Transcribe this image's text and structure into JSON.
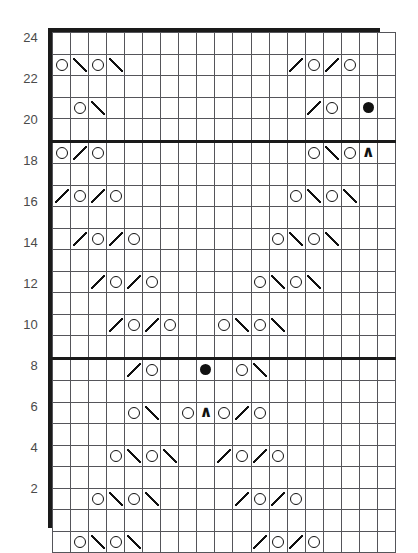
{
  "chart_data": {
    "type": "table",
    "rows": 24,
    "columns": 19,
    "row_numbers_right": [
      23,
      21,
      19,
      17,
      15,
      13,
      11,
      9,
      7,
      5,
      3,
      1
    ],
    "row_numbers_left": [
      24,
      22,
      20,
      18,
      16,
      14,
      12,
      10,
      8,
      6,
      4,
      2
    ],
    "repeat_divider_after_column": 7,
    "section_dividers_after_rows": [
      10,
      20
    ],
    "legend": {
      "O": "yarn-over",
      "/": "k2tog-right-slant-decrease",
      "\\": "ssk-left-slant-decrease",
      "dot": "purl-or-bobble",
      "^": "central-double-decrease"
    },
    "grid": [
      {
        "row": 24,
        "cells": [
          "",
          "",
          "",
          "",
          "",
          "",
          "",
          "",
          "",
          "",
          "",
          "",
          "",
          "",
          "",
          "",
          "",
          "",
          ""
        ]
      },
      {
        "row": 23,
        "cells": [
          "O",
          "/",
          "O",
          "/",
          "",
          "",
          "",
          "",
          "",
          "",
          "",
          "",
          "",
          "\\",
          "O",
          "\\",
          "O",
          "",
          ""
        ]
      },
      {
        "row": 22,
        "cells": [
          "",
          "",
          "",
          "",
          "",
          "",
          "",
          "",
          "",
          "",
          "",
          "",
          "",
          "",
          "",
          "",
          "",
          "",
          ""
        ]
      },
      {
        "row": 21,
        "cells": [
          "",
          "O",
          "/",
          "",
          "",
          "",
          "",
          "",
          "",
          "",
          "",
          "",
          "",
          "",
          "\\",
          "O",
          "",
          "dot",
          ""
        ]
      },
      {
        "row": 20,
        "cells": [
          "",
          "",
          "",
          "",
          "",
          "",
          "",
          "",
          "",
          "",
          "",
          "",
          "",
          "",
          "",
          "",
          "",
          "",
          ""
        ]
      },
      {
        "row": 19,
        "cells": [
          "O",
          "\\",
          "O",
          "",
          "",
          "",
          "",
          "",
          "",
          "",
          "",
          "",
          "",
          "",
          "O",
          "/",
          "O",
          "^",
          ""
        ]
      },
      {
        "row": 18,
        "cells": [
          "",
          "",
          "",
          "",
          "",
          "",
          "",
          "",
          "",
          "",
          "",
          "",
          "",
          "",
          "",
          "",
          "",
          "",
          ""
        ]
      },
      {
        "row": 17,
        "cells": [
          "\\",
          "O",
          "\\",
          "O",
          "",
          "",
          "",
          "",
          "",
          "",
          "",
          "",
          "",
          "O",
          "/",
          "O",
          "/",
          "",
          ""
        ]
      },
      {
        "row": 16,
        "cells": [
          "",
          "",
          "",
          "",
          "",
          "",
          "",
          "",
          "",
          "",
          "",
          "",
          "",
          "",
          "",
          "",
          "",
          "",
          ""
        ]
      },
      {
        "row": 15,
        "cells": [
          "",
          "\\",
          "O",
          "\\",
          "O",
          "",
          "",
          "",
          "",
          "",
          "",
          "",
          "O",
          "/",
          "O",
          "/",
          "",
          "",
          ""
        ]
      },
      {
        "row": 14,
        "cells": [
          "",
          "",
          "",
          "",
          "",
          "",
          "",
          "",
          "",
          "",
          "",
          "",
          "",
          "",
          "",
          "",
          "",
          "",
          ""
        ]
      },
      {
        "row": 13,
        "cells": [
          "",
          "",
          "\\",
          "O",
          "\\",
          "O",
          "",
          "",
          "",
          "",
          "",
          "O",
          "/",
          "O",
          "/",
          "",
          "",
          "",
          ""
        ]
      },
      {
        "row": 12,
        "cells": [
          "",
          "",
          "",
          "",
          "",
          "",
          "",
          "",
          "",
          "",
          "",
          "",
          "",
          "",
          "",
          "",
          "",
          "",
          ""
        ]
      },
      {
        "row": 11,
        "cells": [
          "",
          "",
          "",
          "\\",
          "O",
          "\\",
          "O",
          "",
          "",
          "O",
          "/",
          "O",
          "/",
          "",
          "",
          "",
          "",
          "",
          ""
        ]
      },
      {
        "row": 10,
        "cells": [
          "",
          "",
          "",
          "",
          "",
          "",
          "",
          "",
          "",
          "",
          "",
          "",
          "",
          "",
          "",
          "",
          "",
          "",
          ""
        ]
      },
      {
        "row": 9,
        "cells": [
          "",
          "",
          "",
          "",
          "\\",
          "O",
          "",
          "",
          "dot",
          "",
          "O",
          "/",
          "",
          "",
          "",
          "",
          "",
          "",
          ""
        ]
      },
      {
        "row": 8,
        "cells": [
          "",
          "",
          "",
          "",
          "",
          "",
          "",
          "",
          "",
          "",
          "",
          "",
          "",
          "",
          "",
          "",
          "",
          "",
          ""
        ]
      },
      {
        "row": 7,
        "cells": [
          "",
          "",
          "",
          "",
          "O",
          "/",
          "",
          "O",
          "^",
          "O",
          "\\",
          "O",
          "",
          "",
          "",
          "",
          "",
          "",
          ""
        ]
      },
      {
        "row": 6,
        "cells": [
          "",
          "",
          "",
          "",
          "",
          "",
          "",
          "",
          "",
          "",
          "",
          "",
          "",
          "",
          "",
          "",
          "",
          "",
          ""
        ]
      },
      {
        "row": 5,
        "cells": [
          "",
          "",
          "",
          "O",
          "/",
          "O",
          "/",
          "",
          "",
          "\\",
          "O",
          "\\",
          "O",
          "",
          "",
          "",
          "",
          "",
          ""
        ]
      },
      {
        "row": 4,
        "cells": [
          "",
          "",
          "",
          "",
          "",
          "",
          "",
          "",
          "",
          "",
          "",
          "",
          "",
          "",
          "",
          "",
          "",
          "",
          ""
        ]
      },
      {
        "row": 3,
        "cells": [
          "",
          "",
          "O",
          "/",
          "O",
          "/",
          "",
          "",
          "",
          "",
          "\\",
          "O",
          "\\",
          "O",
          "",
          "",
          "",
          "",
          ""
        ]
      },
      {
        "row": 2,
        "cells": [
          "",
          "",
          "",
          "",
          "",
          "",
          "",
          "",
          "",
          "",
          "",
          "",
          "",
          "",
          "",
          "",
          "",
          "",
          ""
        ]
      },
      {
        "row": 1,
        "cells": [
          "",
          "O",
          "/",
          "O",
          "/",
          "",
          "",
          "",
          "",
          "",
          "",
          "\\",
          "O",
          "\\",
          "O",
          "",
          "",
          "",
          ""
        ]
      }
    ]
  }
}
